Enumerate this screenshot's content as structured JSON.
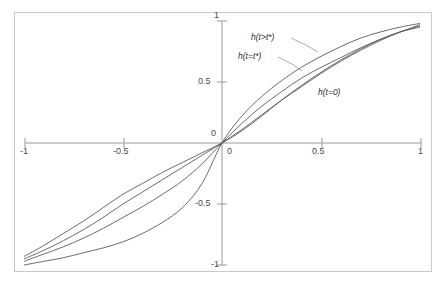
{
  "chart_data": {
    "type": "line",
    "title": "",
    "xlabel": "",
    "ylabel": "",
    "xlim": [
      -1,
      1
    ],
    "ylim": [
      -1,
      1
    ],
    "grid": false,
    "legend": "inline-annotations",
    "x_ticks": [
      {
        "value": -1,
        "label": "-1"
      },
      {
        "value": -0.5,
        "label": "-0.5"
      },
      {
        "value": 0,
        "label": "0"
      },
      {
        "value": 0.5,
        "label": "0.5"
      },
      {
        "value": 1,
        "label": "1"
      }
    ],
    "y_ticks": [
      {
        "value": 1,
        "label": "1"
      },
      {
        "value": 0.5,
        "label": "0.5"
      },
      {
        "value": 0,
        "label": "0"
      },
      {
        "value": -0.5,
        "label": "-0.5"
      },
      {
        "value": -1,
        "label": "-1"
      }
    ],
    "x": [
      -1,
      -0.9,
      -0.8,
      -0.7,
      -0.6,
      -0.5,
      -0.4,
      -0.3,
      -0.2,
      -0.1,
      0,
      0.1,
      0.2,
      0.3,
      0.4,
      0.5,
      0.6,
      0.7,
      0.8,
      0.9,
      1
    ],
    "series": [
      {
        "name": "h(t>t*)",
        "label": "h(t>t*)",
        "color": "#5a5a5a",
        "values": [
          -0.93,
          -0.84,
          -0.74,
          -0.64,
          -0.53,
          -0.42,
          -0.33,
          -0.24,
          -0.16,
          -0.08,
          0,
          0.1,
          0.22,
          0.35,
          0.47,
          0.58,
          0.68,
          0.77,
          0.85,
          0.91,
          0.95
        ]
      },
      {
        "name": "h(t=t*)",
        "label": "h(t=t*)",
        "color": "#5a5a5a",
        "values": [
          -0.95,
          -0.88,
          -0.8,
          -0.71,
          -0.61,
          -0.5,
          -0.4,
          -0.3,
          -0.2,
          -0.1,
          0,
          0.11,
          0.23,
          0.35,
          0.46,
          0.57,
          0.67,
          0.76,
          0.84,
          0.91,
          0.96
        ]
      },
      {
        "name": "h-middle",
        "label": "",
        "color": "#5a5a5a",
        "values": [
          -0.97,
          -0.91,
          -0.85,
          -0.78,
          -0.7,
          -0.61,
          -0.52,
          -0.42,
          -0.31,
          -0.17,
          0,
          0.16,
          0.3,
          0.42,
          0.53,
          0.62,
          0.7,
          0.78,
          0.85,
          0.91,
          0.97
        ]
      },
      {
        "name": "h(t=0)",
        "label": "h(t=0)",
        "color": "#5a5a5a",
        "values": [
          -1.0,
          -0.97,
          -0.94,
          -0.9,
          -0.86,
          -0.81,
          -0.74,
          -0.65,
          -0.53,
          -0.33,
          0,
          0.22,
          0.38,
          0.51,
          0.62,
          0.71,
          0.79,
          0.86,
          0.91,
          0.95,
          0.98
        ]
      }
    ],
    "annotations": [
      {
        "text": "h(t>t*)",
        "name": "label-h-t-greater-tstar"
      },
      {
        "text": "h(t=t*)",
        "name": "label-h-t-equals-tstar"
      },
      {
        "text": "h(t=0)",
        "name": "label-h-t-equals-0"
      }
    ],
    "axis_color": "#9a9a9a",
    "curve_color": "#5a5a5a",
    "frame_color": "#c9c9c9",
    "background": "#ffffff"
  }
}
